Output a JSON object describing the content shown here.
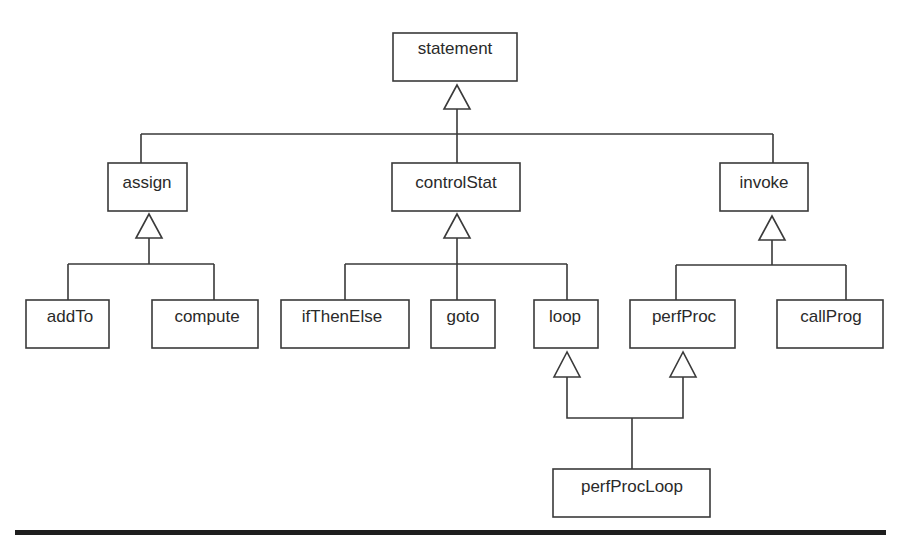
{
  "diagram": {
    "type": "class-inheritance-hierarchy",
    "nodes": {
      "statement": {
        "label": "statement"
      },
      "assign": {
        "label": "assign"
      },
      "controlStat": {
        "label": "controlStat"
      },
      "invoke": {
        "label": "invoke"
      },
      "addTo": {
        "label": "addTo"
      },
      "compute": {
        "label": "compute"
      },
      "ifThenElse": {
        "label": "ifThenElse"
      },
      "goto": {
        "label": "goto"
      },
      "loop": {
        "label": "loop"
      },
      "perfProc": {
        "label": "perfProc"
      },
      "callProg": {
        "label": "callProg"
      },
      "perfProcLoop": {
        "label": "perfProcLoop"
      }
    },
    "edges": [
      {
        "child": "assign",
        "parent": "statement",
        "kind": "generalization"
      },
      {
        "child": "controlStat",
        "parent": "statement",
        "kind": "generalization"
      },
      {
        "child": "invoke",
        "parent": "statement",
        "kind": "generalization"
      },
      {
        "child": "addTo",
        "parent": "assign",
        "kind": "generalization"
      },
      {
        "child": "compute",
        "parent": "assign",
        "kind": "generalization"
      },
      {
        "child": "ifThenElse",
        "parent": "controlStat",
        "kind": "generalization"
      },
      {
        "child": "goto",
        "parent": "controlStat",
        "kind": "generalization"
      },
      {
        "child": "loop",
        "parent": "controlStat",
        "kind": "generalization"
      },
      {
        "child": "perfProc",
        "parent": "invoke",
        "kind": "generalization"
      },
      {
        "child": "callProg",
        "parent": "invoke",
        "kind": "generalization"
      },
      {
        "child": "perfProcLoop",
        "parent": "loop",
        "kind": "generalization"
      },
      {
        "child": "perfProcLoop",
        "parent": "perfProc",
        "kind": "generalization"
      }
    ],
    "colors": {
      "stroke": "#3a3a3a",
      "text": "#2a2a2a",
      "rule": "#1e1e1e",
      "background": "#ffffff"
    }
  }
}
